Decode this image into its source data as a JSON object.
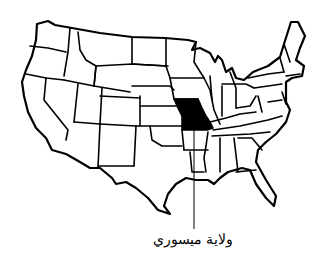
{
  "map": {
    "subject": "United States of America - state outline map",
    "highlighted_region": "Missouri",
    "colors": {
      "background": "#ffffff",
      "stroke": "#000000",
      "highlight_fill": "#000000"
    }
  },
  "callout": {
    "label": "ولاية ميسوري",
    "target": "Missouri"
  }
}
